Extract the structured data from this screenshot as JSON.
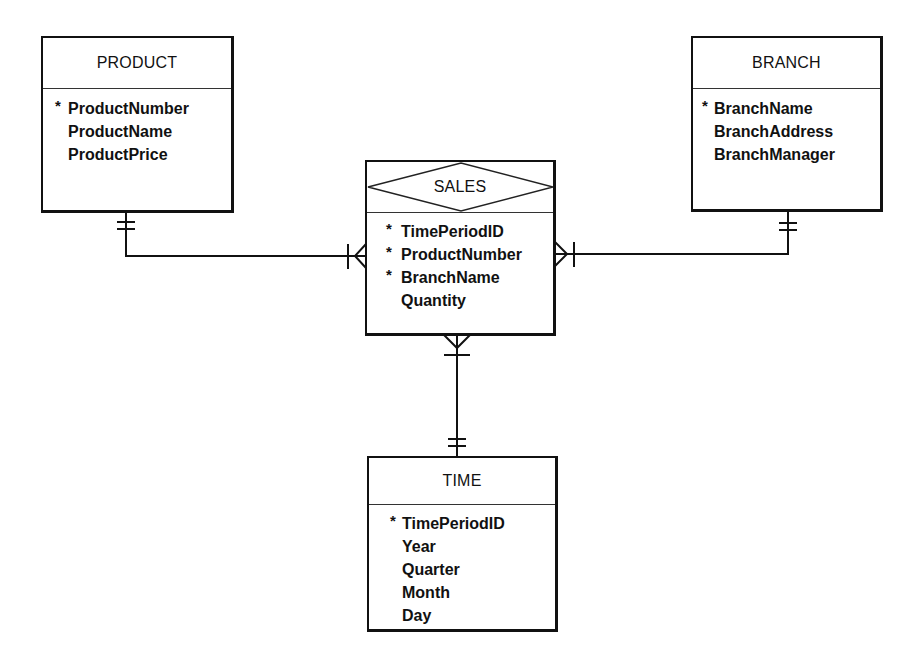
{
  "diagram": {
    "type": "entity-relationship",
    "key_marker": "*",
    "entities": {
      "product": {
        "name": "PRODUCT",
        "attributes": [
          {
            "name": "ProductNumber",
            "key": true
          },
          {
            "name": "ProductName",
            "key": false
          },
          {
            "name": "ProductPrice",
            "key": false
          }
        ]
      },
      "branch": {
        "name": "BRANCH",
        "attributes": [
          {
            "name": "BranchName",
            "key": true
          },
          {
            "name": "BranchAddress",
            "key": false
          },
          {
            "name": "BranchManager",
            "key": false
          }
        ]
      },
      "sales": {
        "name": "SALES",
        "kind": "associative",
        "attributes": [
          {
            "name": "TimePeriodID",
            "key": true
          },
          {
            "name": "ProductNumber",
            "key": true
          },
          {
            "name": "BranchName",
            "key": true
          },
          {
            "name": "Quantity",
            "key": false
          }
        ]
      },
      "time": {
        "name": "TIME",
        "attributes": [
          {
            "name": "TimePeriodID",
            "key": true
          },
          {
            "name": "Year",
            "key": false
          },
          {
            "name": "Quarter",
            "key": false
          },
          {
            "name": "Month",
            "key": false
          },
          {
            "name": "Day",
            "key": false
          }
        ]
      }
    },
    "relationships": [
      {
        "from": "PRODUCT",
        "from_cardinality": "one-and-only-one",
        "to": "SALES",
        "to_cardinality": "one-or-many"
      },
      {
        "from": "BRANCH",
        "from_cardinality": "one-and-only-one",
        "to": "SALES",
        "to_cardinality": "one-or-many"
      },
      {
        "from": "TIME",
        "from_cardinality": "one-and-only-one",
        "to": "SALES",
        "to_cardinality": "one-or-many"
      }
    ]
  },
  "colors": {
    "line": "#111111",
    "background": "#ffffff"
  }
}
